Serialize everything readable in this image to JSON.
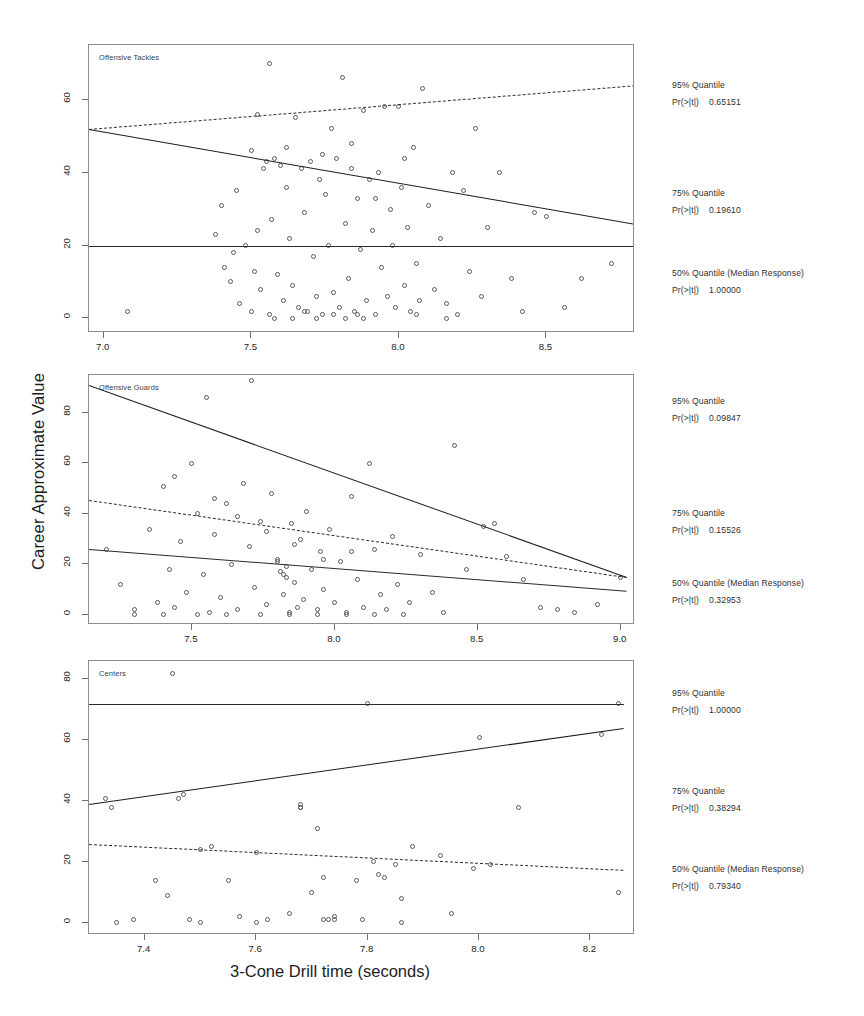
{
  "figure": {
    "ylabel": "Career Approximate Value",
    "xlabel": "3-Cone Drill time (seconds)"
  },
  "chart_data": {
    "type": "scatter",
    "title": "",
    "xlabel": "3-Cone Drill time (seconds)",
    "ylabel": "Career Approximate Value",
    "grid": false,
    "legend_position": "right",
    "panels": [
      {
        "name": "Offensive Tackles",
        "xlim": [
          6.95,
          8.8
        ],
        "ylim": [
          -4,
          75
        ],
        "xticks": [
          "7.0",
          "7.5",
          "8.0",
          "8.5"
        ],
        "xtickvals": [
          7.0,
          7.5,
          8.0,
          8.5
        ],
        "yticks": [
          "0",
          "20",
          "40",
          "60"
        ],
        "ytickvals": [
          0,
          20,
          40,
          60
        ],
        "fits": [
          {
            "quantile": "95%",
            "x": [
              6.95,
              8.8
            ],
            "y": [
              52.0,
              64.0
            ],
            "style": "dashed"
          },
          {
            "quantile": "75%",
            "x": [
              6.95,
              8.8
            ],
            "y": [
              52.0,
              26.0
            ],
            "style": "solid"
          },
          {
            "quantile": "50%",
            "x": [
              6.95,
              8.8
            ],
            "y": [
              20.0,
              20.0
            ],
            "style": "thin"
          }
        ],
        "annotations": [
          {
            "label": "95% Quantile",
            "stat": "Pr(>|t|)",
            "value": "0.65151"
          },
          {
            "label": "75% Quantile",
            "stat": "Pr(>|t|)",
            "value": "0.19610"
          },
          {
            "label": "50% Quantile (Median Response)",
            "stat": "Pr(>|t|)",
            "value": "1.00000"
          }
        ],
        "points": [
          [
            7.08,
            2
          ],
          [
            7.38,
            23
          ],
          [
            7.4,
            31
          ],
          [
            7.41,
            14
          ],
          [
            7.43,
            10
          ],
          [
            7.45,
            35
          ],
          [
            7.46,
            4
          ],
          [
            7.48,
            20
          ],
          [
            7.5,
            46
          ],
          [
            7.51,
            13
          ],
          [
            7.52,
            56
          ],
          [
            7.53,
            8
          ],
          [
            7.54,
            41
          ],
          [
            7.55,
            43
          ],
          [
            7.56,
            70
          ],
          [
            7.57,
            27
          ],
          [
            7.58,
            44
          ],
          [
            7.59,
            12
          ],
          [
            7.6,
            42
          ],
          [
            7.61,
            5
          ],
          [
            7.62,
            47
          ],
          [
            7.63,
            22
          ],
          [
            7.64,
            9
          ],
          [
            7.65,
            55
          ],
          [
            7.66,
            3
          ],
          [
            7.67,
            41
          ],
          [
            7.68,
            29
          ],
          [
            7.69,
            2
          ],
          [
            7.7,
            43
          ],
          [
            7.71,
            17
          ],
          [
            7.72,
            6
          ],
          [
            7.73,
            38
          ],
          [
            7.74,
            1
          ],
          [
            7.75,
            34
          ],
          [
            7.76,
            20
          ],
          [
            7.77,
            52
          ],
          [
            7.78,
            7
          ],
          [
            7.79,
            44
          ],
          [
            7.8,
            3
          ],
          [
            7.81,
            66
          ],
          [
            7.82,
            26
          ],
          [
            7.83,
            11
          ],
          [
            7.84,
            48
          ],
          [
            7.85,
            2
          ],
          [
            7.86,
            33
          ],
          [
            7.87,
            19
          ],
          [
            7.88,
            57
          ],
          [
            7.89,
            5
          ],
          [
            7.9,
            38
          ],
          [
            7.91,
            24
          ],
          [
            7.92,
            1
          ],
          [
            7.93,
            40
          ],
          [
            7.94,
            14
          ],
          [
            7.95,
            58
          ],
          [
            7.96,
            6
          ],
          [
            7.97,
            30
          ],
          [
            7.98,
            20
          ],
          [
            7.99,
            3
          ],
          [
            8.0,
            58
          ],
          [
            8.01,
            36
          ],
          [
            8.02,
            9
          ],
          [
            8.03,
            25
          ],
          [
            8.04,
            2
          ],
          [
            8.05,
            47
          ],
          [
            8.06,
            15
          ],
          [
            8.07,
            5
          ],
          [
            8.08,
            63
          ],
          [
            8.1,
            31
          ],
          [
            8.12,
            8
          ],
          [
            8.14,
            22
          ],
          [
            8.16,
            4
          ],
          [
            8.18,
            40
          ],
          [
            8.2,
            1
          ],
          [
            8.22,
            35
          ],
          [
            8.24,
            13
          ],
          [
            8.26,
            52
          ],
          [
            8.28,
            6
          ],
          [
            8.3,
            25
          ],
          [
            8.34,
            40
          ],
          [
            8.38,
            11
          ],
          [
            8.42,
            2
          ],
          [
            8.46,
            29
          ],
          [
            8.5,
            28
          ],
          [
            8.56,
            3
          ],
          [
            8.62,
            11
          ],
          [
            8.72,
            15
          ],
          [
            7.56,
            1
          ],
          [
            7.58,
            0
          ],
          [
            7.72,
            0
          ],
          [
            7.78,
            1
          ],
          [
            7.82,
            0
          ],
          [
            7.86,
            1
          ],
          [
            7.5,
            2
          ],
          [
            7.64,
            0
          ],
          [
            7.68,
            2
          ],
          [
            7.88,
            0
          ],
          [
            8.06,
            1
          ],
          [
            8.16,
            0
          ],
          [
            7.44,
            18
          ],
          [
            7.52,
            24
          ],
          [
            7.62,
            36
          ],
          [
            7.74,
            45
          ],
          [
            7.84,
            41
          ],
          [
            7.92,
            33
          ],
          [
            8.02,
            44
          ]
        ]
      },
      {
        "name": "Offensive Guards",
        "xlim": [
          7.14,
          9.05
        ],
        "ylim": [
          -4,
          95
        ],
        "xticks": [
          "7.5",
          "8.0",
          "8.5",
          "9.0"
        ],
        "xtickvals": [
          7.5,
          8.0,
          8.5,
          9.0
        ],
        "yticks": [
          "0",
          "20",
          "40",
          "60",
          "80"
        ],
        "ytickvals": [
          0,
          20,
          40,
          60,
          80
        ],
        "fits": [
          {
            "quantile": "95%",
            "x": [
              7.14,
              9.02
            ],
            "y": [
              91.0,
              15.0
            ],
            "style": "solid"
          },
          {
            "quantile": "75%",
            "x": [
              7.14,
              9.02
            ],
            "y": [
              45.5,
              15.0
            ],
            "style": "dashed"
          },
          {
            "quantile": "50%",
            "x": [
              7.14,
              9.02
            ],
            "y": [
              26.0,
              9.5
            ],
            "style": "thin"
          }
        ],
        "annotations": [
          {
            "label": "95% Quantile",
            "stat": "Pr(>|t|)",
            "value": "0.09847"
          },
          {
            "label": "75% Quantile",
            "stat": "Pr(>|t|)",
            "value": "0.15526"
          },
          {
            "label": "50% Quantile (Median Response)",
            "stat": "Pr(>|t|)",
            "value": "0.32953"
          }
        ],
        "points": [
          [
            7.2,
            26
          ],
          [
            7.25,
            12
          ],
          [
            7.3,
            2
          ],
          [
            7.35,
            34
          ],
          [
            7.38,
            5
          ],
          [
            7.4,
            51
          ],
          [
            7.42,
            18
          ],
          [
            7.44,
            3
          ],
          [
            7.46,
            29
          ],
          [
            7.48,
            9
          ],
          [
            7.5,
            60
          ],
          [
            7.52,
            40
          ],
          [
            7.54,
            16
          ],
          [
            7.55,
            86
          ],
          [
            7.56,
            1
          ],
          [
            7.58,
            32
          ],
          [
            7.6,
            7
          ],
          [
            7.62,
            44
          ],
          [
            7.64,
            20
          ],
          [
            7.66,
            2
          ],
          [
            7.68,
            52
          ],
          [
            7.7,
            27
          ],
          [
            7.71,
            93
          ],
          [
            7.72,
            11
          ],
          [
            7.74,
            37
          ],
          [
            7.76,
            4
          ],
          [
            7.78,
            48
          ],
          [
            7.8,
            22
          ],
          [
            7.81,
            17
          ],
          [
            7.82,
            8
          ],
          [
            7.83,
            19
          ],
          [
            7.84,
            1
          ],
          [
            7.85,
            36
          ],
          [
            7.86,
            13
          ],
          [
            7.87,
            3
          ],
          [
            7.88,
            30
          ],
          [
            7.89,
            6
          ],
          [
            7.9,
            41
          ],
          [
            7.92,
            18
          ],
          [
            7.94,
            2
          ],
          [
            7.95,
            25
          ],
          [
            7.96,
            10
          ],
          [
            7.98,
            34
          ],
          [
            8.0,
            5
          ],
          [
            8.02,
            21
          ],
          [
            8.04,
            1
          ],
          [
            8.06,
            47
          ],
          [
            8.08,
            14
          ],
          [
            8.1,
            3
          ],
          [
            8.12,
            60
          ],
          [
            8.14,
            26
          ],
          [
            8.16,
            8
          ],
          [
            8.18,
            2
          ],
          [
            8.2,
            31
          ],
          [
            8.22,
            12
          ],
          [
            8.26,
            5
          ],
          [
            8.3,
            24
          ],
          [
            8.34,
            9
          ],
          [
            8.38,
            1
          ],
          [
            8.42,
            67
          ],
          [
            8.46,
            18
          ],
          [
            8.52,
            35
          ],
          [
            8.56,
            36
          ],
          [
            8.6,
            23
          ],
          [
            8.66,
            14
          ],
          [
            8.72,
            3
          ],
          [
            8.78,
            2
          ],
          [
            8.84,
            1
          ],
          [
            8.92,
            4
          ],
          [
            9.0,
            15
          ],
          [
            7.44,
            55
          ],
          [
            7.58,
            46
          ],
          [
            7.66,
            39
          ],
          [
            7.76,
            33
          ],
          [
            7.86,
            28
          ],
          [
            7.96,
            22
          ],
          [
            8.06,
            25
          ],
          [
            7.3,
            0
          ],
          [
            7.4,
            0
          ],
          [
            7.52,
            0
          ],
          [
            7.62,
            0
          ],
          [
            7.74,
            0
          ],
          [
            7.84,
            0
          ],
          [
            7.94,
            0
          ],
          [
            8.04,
            0
          ],
          [
            8.14,
            0
          ],
          [
            8.24,
            0
          ],
          [
            7.82,
            16
          ],
          [
            7.83,
            15
          ],
          [
            7.8,
            21
          ]
        ]
      },
      {
        "name": "Centers",
        "xlim": [
          7.3,
          8.28
        ],
        "ylim": [
          -4,
          86
        ],
        "xticks": [
          "7.4",
          "7.6",
          "7.8",
          "8.0",
          "8.2"
        ],
        "xtickvals": [
          7.4,
          7.6,
          7.8,
          8.0,
          8.2
        ],
        "yticks": [
          "0",
          "20",
          "40",
          "60",
          "80"
        ],
        "ytickvals": [
          0,
          20,
          40,
          60,
          80
        ],
        "fits": [
          {
            "quantile": "95%",
            "x": [
              7.3,
              8.26
            ],
            "y": [
              72.0,
              72.0
            ],
            "style": "thin"
          },
          {
            "quantile": "75%",
            "x": [
              7.3,
              8.26
            ],
            "y": [
              39.0,
              64.0
            ],
            "style": "solid"
          },
          {
            "quantile": "50%",
            "x": [
              7.3,
              8.26
            ],
            "y": [
              26.0,
              17.5
            ],
            "style": "dashed"
          }
        ],
        "annotations": [
          {
            "label": "95% Quantile",
            "stat": "Pr(>|t|)",
            "value": "1.00000"
          },
          {
            "label": "75% Quantile",
            "stat": "Pr(>|t|)",
            "value": "0.38294"
          },
          {
            "label": "50% Quantile (Median Response)",
            "stat": "Pr(>|t|)",
            "value": "0.79340"
          }
        ],
        "points": [
          [
            7.33,
            41
          ],
          [
            7.34,
            38
          ],
          [
            7.35,
            0
          ],
          [
            7.38,
            1
          ],
          [
            7.42,
            14
          ],
          [
            7.44,
            9
          ],
          [
            7.45,
            82
          ],
          [
            7.46,
            41
          ],
          [
            7.47,
            42
          ],
          [
            7.48,
            1
          ],
          [
            7.5,
            24
          ],
          [
            7.52,
            25
          ],
          [
            7.55,
            14
          ],
          [
            7.57,
            2
          ],
          [
            7.6,
            23
          ],
          [
            7.62,
            1
          ],
          [
            7.66,
            3
          ],
          [
            7.68,
            38
          ],
          [
            7.7,
            10
          ],
          [
            7.71,
            31
          ],
          [
            7.72,
            15
          ],
          [
            7.73,
            1
          ],
          [
            7.74,
            2
          ],
          [
            7.78,
            14
          ],
          [
            7.79,
            1
          ],
          [
            7.8,
            72
          ],
          [
            7.81,
            20
          ],
          [
            7.82,
            16
          ],
          [
            7.83,
            15
          ],
          [
            7.85,
            19
          ],
          [
            7.86,
            8
          ],
          [
            7.88,
            25
          ],
          [
            7.93,
            22
          ],
          [
            7.95,
            3
          ],
          [
            7.99,
            18
          ],
          [
            8.0,
            61
          ],
          [
            8.02,
            19
          ],
          [
            8.07,
            38
          ],
          [
            8.22,
            62
          ],
          [
            8.25,
            72
          ],
          [
            8.25,
            10
          ],
          [
            7.68,
            39
          ],
          [
            7.68,
            38
          ],
          [
            7.5,
            0
          ],
          [
            7.6,
            0
          ],
          [
            7.72,
            1
          ],
          [
            7.74,
            1
          ],
          [
            7.86,
            0
          ]
        ]
      }
    ]
  }
}
